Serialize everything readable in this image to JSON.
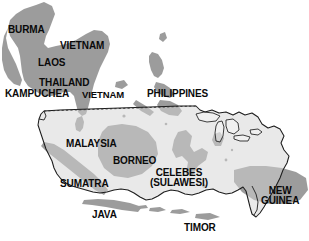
{
  "map": {
    "title": "Southeast Asia compared to the continental United States",
    "type": "scale-comparison-map",
    "colors": {
      "background": "#ffffff",
      "land_dark": "#9a9a9a",
      "land_mid": "#a8a8a8",
      "us_overlay_fill": "#d2d2d2",
      "us_outline_stroke": "#1a1a1a",
      "label_text": "#0a0a0a"
    },
    "overlay": {
      "name": "continental-united-states-outline",
      "stroke_width": 1,
      "fill_opacity": 0.45,
      "includes_great_lakes": true
    },
    "labels": [
      {
        "id": "burma",
        "text": "BURMA",
        "x": 8,
        "y": 25,
        "size": "md",
        "lines": [
          "BURMA"
        ]
      },
      {
        "id": "vietnam-n",
        "text": "VIETNAM",
        "x": 60,
        "y": 41,
        "size": "md",
        "lines": [
          "VIETNAM"
        ]
      },
      {
        "id": "laos",
        "text": "LAOS",
        "x": 38,
        "y": 58,
        "size": "md",
        "lines": [
          "LAOS"
        ]
      },
      {
        "id": "thailand",
        "text": "THAILAND",
        "x": 39,
        "y": 78,
        "size": "md",
        "lines": [
          "THAILAND"
        ]
      },
      {
        "id": "kampuchea",
        "text": "KAMPUCHEA",
        "x": 5,
        "y": 89,
        "size": "md",
        "lines": [
          "KAMPUCHEA"
        ]
      },
      {
        "id": "vietnam-s",
        "text": "VIETNAM",
        "x": 82,
        "y": 90,
        "size": "sm",
        "lines": [
          "VIETNAM"
        ]
      },
      {
        "id": "philippines",
        "text": "PHILIPPINES",
        "x": 147,
        "y": 89,
        "size": "md",
        "lines": [
          "PHILIPPINES"
        ]
      },
      {
        "id": "malaysia",
        "text": "MALAYSIA",
        "x": 66,
        "y": 139,
        "size": "md",
        "lines": [
          "MALAYSIA"
        ]
      },
      {
        "id": "borneo",
        "text": "BORNEO",
        "x": 113,
        "y": 156,
        "size": "md",
        "lines": [
          "BORNEO"
        ]
      },
      {
        "id": "celebes",
        "text": "CELEBES (SULAWESI)",
        "x": 150,
        "y": 168,
        "size": "md",
        "lines": [
          "CELEBES",
          "(SULAWESI)"
        ]
      },
      {
        "id": "sumatra",
        "text": "SUMATRA",
        "x": 60,
        "y": 179,
        "size": "md",
        "lines": [
          "SUMATRA"
        ]
      },
      {
        "id": "new-guinea",
        "text": "NEW GUINEA",
        "x": 261,
        "y": 186,
        "size": "md",
        "lines": [
          "NEW",
          "GUINEA"
        ]
      },
      {
        "id": "java",
        "text": "JAVA",
        "x": 92,
        "y": 210,
        "size": "md",
        "lines": [
          "JAVA"
        ]
      },
      {
        "id": "timor",
        "text": "TIMOR",
        "x": 184,
        "y": 223,
        "size": "md",
        "lines": [
          "TIMOR"
        ]
      }
    ]
  }
}
